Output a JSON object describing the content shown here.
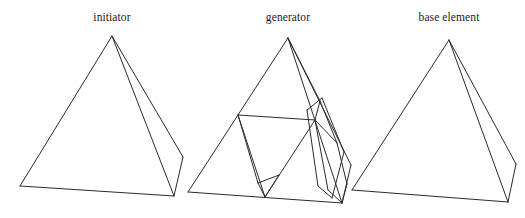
{
  "figure": {
    "type": "line-diagram",
    "background_color": "#ffffff",
    "line_color": "#2b2b2b",
    "panels": [
      {
        "id": "initiator",
        "label": "initiator",
        "shape": "tetrahedron",
        "vertices": {
          "apex": [
            112,
            36
          ],
          "front_left": [
            20,
            186
          ],
          "front_right": [
            174,
            196
          ],
          "back_right": [
            183,
            157
          ]
        },
        "edges": [
          [
            "apex",
            "front_left"
          ],
          [
            "apex",
            "front_right"
          ],
          [
            "apex",
            "back_right"
          ],
          [
            "front_left",
            "front_right"
          ],
          [
            "front_right",
            "back_right"
          ]
        ]
      },
      {
        "id": "generator",
        "label": "generator",
        "shape": "sierpinski-tetrahedron-iteration-1",
        "sub_tetrahedra_count": 4,
        "vertices": {
          "apex": [
            288,
            38
          ],
          "front_left": [
            188,
            192
          ],
          "front_right": [
            342,
            203
          ],
          "back_right": [
            351,
            165
          ],
          "mid_apex_left": [
            238,
            115
          ],
          "mid_apex_right": [
            315,
            120
          ],
          "mid_front_base": [
            265,
            197
          ],
          "mid_apex_back": [
            320,
            101
          ],
          "mid_back_right": [
            347,
            184
          ],
          "mid_left_back": [
            337,
            143
          ]
        }
      },
      {
        "id": "base-element",
        "label": "base element",
        "shape": "tetrahedron",
        "vertices": {
          "apex": [
            449,
            40
          ],
          "front_left": [
            352,
            190
          ],
          "front_right": [
            508,
            202
          ],
          "back_right": [
            516,
            164
          ]
        },
        "edges": [
          [
            "apex",
            "front_left"
          ],
          [
            "apex",
            "front_right"
          ],
          [
            "apex",
            "back_right"
          ],
          [
            "front_left",
            "front_right"
          ],
          [
            "front_right",
            "back_right"
          ]
        ]
      }
    ]
  }
}
